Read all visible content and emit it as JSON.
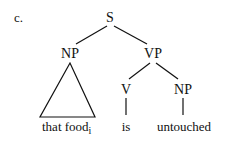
{
  "example_label": "c.",
  "tree": {
    "root": "S",
    "subject": {
      "label": "NP",
      "leaf": "that food",
      "subscript": "i",
      "collapsed": true
    },
    "predicate": {
      "label": "VP",
      "verb": {
        "label": "V",
        "leaf": "is"
      },
      "object": {
        "label": "NP",
        "leaf": "untouched"
      }
    }
  },
  "colors": {
    "ink": "#111111",
    "background": "#ffffff"
  }
}
